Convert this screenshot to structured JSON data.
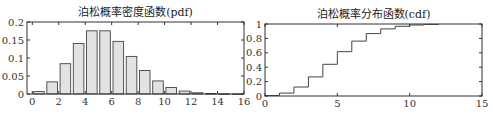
{
  "chart_data": [
    {
      "type": "bar",
      "title": "泊松概率密度函数(pdf)",
      "xlabel": "",
      "ylabel": "",
      "categories": [
        0,
        1,
        2,
        3,
        4,
        5,
        6,
        7,
        8,
        9,
        10,
        11,
        12,
        13,
        14,
        15
      ],
      "values": [
        0.0067,
        0.0337,
        0.0842,
        0.1404,
        0.1755,
        0.1755,
        0.1462,
        0.1044,
        0.0653,
        0.0363,
        0.0181,
        0.0082,
        0.0034,
        0.0013,
        0.0005,
        0.0002
      ],
      "xlim": [
        -0.4,
        16
      ],
      "ylim": [
        0,
        0.2
      ],
      "xticks": [
        0,
        2,
        4,
        6,
        8,
        10,
        12,
        14,
        16
      ],
      "xtick_labels": [
        "0",
        "2",
        "4",
        "6",
        "8",
        "10",
        "12",
        "14",
        "16"
      ],
      "yticks": [
        0,
        0.05,
        0.1,
        0.15,
        0.2
      ],
      "ytick_labels": [
        "0",
        "0.05",
        "0.1",
        "0.15",
        "0.2"
      ],
      "grid": false,
      "bar_color": "#e2e2e2",
      "edge_color": "#444444"
    },
    {
      "type": "line",
      "subtype": "stairs",
      "title": "泊松概率分布函数(cdf)",
      "xlabel": "",
      "ylabel": "",
      "x": [
        0,
        1,
        2,
        3,
        4,
        5,
        6,
        7,
        8,
        9,
        10,
        11
      ],
      "values": [
        0.0067,
        0.0404,
        0.1247,
        0.265,
        0.4405,
        0.616,
        0.7622,
        0.8666,
        0.9319,
        0.9682,
        0.9863,
        0.9945
      ],
      "xlim": [
        0,
        15
      ],
      "ylim": [
        0,
        1
      ],
      "xticks": [
        0,
        5,
        10,
        15
      ],
      "xtick_labels": [
        "0",
        "5",
        "10",
        "15"
      ],
      "yticks": [
        0,
        0.2,
        0.4,
        0.6,
        0.8,
        1
      ],
      "ytick_labels": [
        "0",
        "0.2",
        "0.4",
        "0.6",
        "0.8",
        "1"
      ],
      "grid": false,
      "line_color": "#444444"
    }
  ]
}
